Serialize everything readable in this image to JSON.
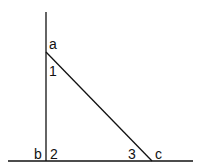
{
  "diagram": {
    "type": "right-triangle-geometry",
    "stroke_color": "#111111",
    "background": "#ffffff",
    "lines": {
      "vertical": {
        "x1": 46,
        "y1": 12,
        "x2": 46,
        "y2": 161
      },
      "horizontal": {
        "x1": 8,
        "y1": 161,
        "x2": 193,
        "y2": 161
      },
      "hypotenuse": {
        "x1": 46,
        "y1": 52,
        "x2": 152,
        "y2": 161
      }
    },
    "points": {
      "a": {
        "label": "a",
        "x": 46,
        "y": 52
      },
      "b": {
        "label": "b",
        "x": 46,
        "y": 161
      },
      "c": {
        "label": "c",
        "x": 152,
        "y": 161
      }
    },
    "angles": {
      "angle1": {
        "label": "1"
      },
      "angle2": {
        "label": "2"
      },
      "angle3": {
        "label": "3"
      }
    }
  }
}
